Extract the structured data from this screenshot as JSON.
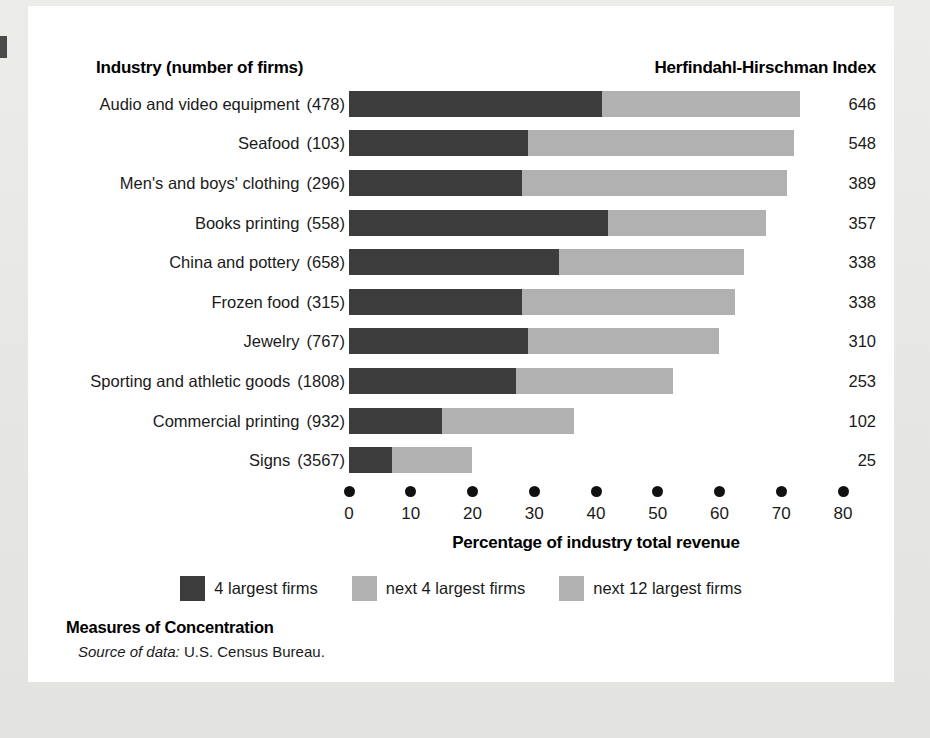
{
  "figure": {
    "column_header_left": "Industry (number of firms)",
    "column_header_right": "Herfindahl-Hirschman Index",
    "caption_title": "Measures of Concentration",
    "caption_source_label": "Source of data:",
    "caption_source_value": "U.S. Census Bureau."
  },
  "colors": {
    "segment_4_largest": "#3c3c3c",
    "segment_next_4": "#b1b1b1",
    "segment_next_12": "#b1b1b1",
    "panel_background": "#ffffff",
    "page_background": "#e8e8e6",
    "text": "#1a1a1a"
  },
  "legend": {
    "items": [
      {
        "label": "4 largest firms",
        "color": "#3c3c3c",
        "swatch": "legend-swatch-dark"
      },
      {
        "label": "next 4 largest firms",
        "color": "#b1b1b1",
        "swatch": "legend-swatch-light"
      },
      {
        "label": "next 12 largest firms",
        "color": "#b1b1b1",
        "swatch": "legend-swatch-light"
      }
    ]
  },
  "chart_data": {
    "type": "bar",
    "orientation": "horizontal",
    "stacked": true,
    "title": "Measures of Concentration",
    "xlabel": "Percentage of industry total revenue",
    "ylabel": "Industry (number of firms)",
    "xlim": [
      0,
      80
    ],
    "xticks": [
      0,
      10,
      20,
      30,
      40,
      50,
      60,
      70,
      80
    ],
    "xticklabels": [
      "0",
      "10",
      "20",
      "30",
      "40",
      "50",
      "60",
      "70",
      "80"
    ],
    "grid": false,
    "legend_position": "bottom-center",
    "categories": [
      "Audio and video equipment",
      "Seafood",
      "Men's and boys' clothing",
      "Books printing",
      "China and pottery",
      "Frozen food",
      "Jewelry",
      "Sporting and athletic goods",
      "Commercial printing",
      "Signs"
    ],
    "number_of_firms": [
      478,
      103,
      296,
      558,
      658,
      315,
      767,
      1808,
      932,
      3567
    ],
    "series": [
      {
        "name": "4 largest firms",
        "color": "#3c3c3c",
        "values": [
          41,
          29,
          28,
          42,
          34,
          28,
          29,
          27,
          15,
          7
        ]
      },
      {
        "name": "next 4 largest firms",
        "color": "#b1b1b1",
        "values": [
          16,
          21,
          21,
          13,
          15,
          17,
          15,
          13,
          11,
          7
        ]
      },
      {
        "name": "next 12 largest firms",
        "color": "#b1b1b1",
        "values": [
          16,
          22,
          22,
          12.5,
          15,
          17.5,
          16,
          12.5,
          10.5,
          6
        ]
      }
    ],
    "cumulative_totals": [
      73,
      72,
      71,
      67.5,
      64,
      62.5,
      60,
      52.5,
      36.5,
      20
    ],
    "hhi_values": [
      646,
      548,
      389,
      357,
      338,
      338,
      310,
      253,
      102,
      25
    ]
  },
  "rows": [
    {
      "industry": "Audio and video equipment",
      "firms": "(478)",
      "hhi": "646",
      "seg1": 41,
      "seg_end_1": 41,
      "seg_end_2": 57,
      "total": 73
    },
    {
      "industry": "Seafood",
      "firms": "(103)",
      "hhi": "548",
      "seg1": 29,
      "seg_end_1": 29,
      "seg_end_2": 50,
      "total": 72
    },
    {
      "industry": "Men's and boys' clothing",
      "firms": "(296)",
      "hhi": "389",
      "seg1": 28,
      "seg_end_1": 28,
      "seg_end_2": 49,
      "total": 71
    },
    {
      "industry": "Books printing",
      "firms": "(558)",
      "hhi": "357",
      "seg1": 42,
      "seg_end_1": 42,
      "seg_end_2": 55,
      "total": 67.5
    },
    {
      "industry": "China and pottery",
      "firms": "(658)",
      "hhi": "338",
      "seg1": 34,
      "seg_end_1": 34,
      "seg_end_2": 49,
      "total": 64
    },
    {
      "industry": "Frozen food",
      "firms": "(315)",
      "hhi": "338",
      "seg1": 28,
      "seg_end_1": 28,
      "seg_end_2": 45,
      "total": 62.5
    },
    {
      "industry": "Jewelry",
      "firms": "(767)",
      "hhi": "310",
      "seg1": 29,
      "seg_end_1": 29,
      "seg_end_2": 44,
      "total": 60
    },
    {
      "industry": "Sporting and athletic goods",
      "firms": "(1808)",
      "hhi": "253",
      "seg1": 27,
      "seg_end_1": 27,
      "seg_end_2": 40,
      "total": 52.5
    },
    {
      "industry": "Commercial printing",
      "firms": "(932)",
      "hhi": "102",
      "seg1": 15,
      "seg_end_1": 15,
      "seg_end_2": 26,
      "total": 36.5
    },
    {
      "industry": "Signs",
      "firms": "(3567)",
      "hhi": "25",
      "seg1": 7,
      "seg_end_1": 7,
      "seg_end_2": 14,
      "total": 20
    }
  ],
  "axis": {
    "title": "Percentage of industry total revenue",
    "ticks": [
      "0",
      "10",
      "20",
      "30",
      "40",
      "50",
      "60",
      "70",
      "80"
    ],
    "min": 0,
    "max": 80
  }
}
